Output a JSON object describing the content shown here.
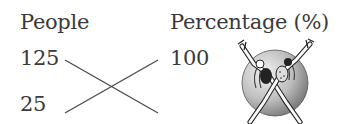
{
  "diagram": {
    "type": "cross-multiplication proportion",
    "headers": {
      "left": "People",
      "right": "Percentage (%)"
    },
    "left_values": [
      "125",
      "25"
    ],
    "right_values": [
      "100",
      ""
    ],
    "connections": [
      {
        "from": "125",
        "to": "right-bottom (unknown)"
      },
      {
        "from": "25",
        "to": "100"
      }
    ],
    "illustration": "two-dancers-leaping-crossed-on-sphere"
  },
  "colors": {
    "text": "#3a3a3a",
    "lines": "#4a4a4a",
    "sphere_light": "#e6e6e6",
    "sphere_dark": "#8a8a8a"
  }
}
